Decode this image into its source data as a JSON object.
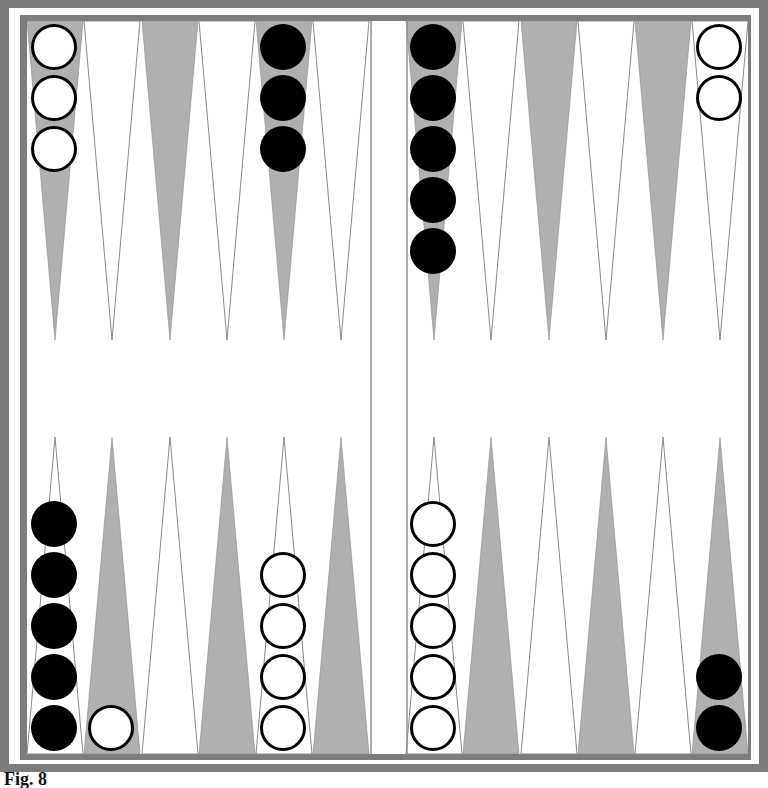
{
  "caption": "Fig. 8",
  "colors": {
    "frame": "#7d7d7d",
    "shaded_point": "#b0b0b0",
    "point_outline": "#8a8a8a",
    "board_bg": "#ffffff",
    "black_checker": "#000000",
    "white_checker_fill": "#ffffff",
    "white_checker_stroke": "#000000"
  },
  "board": {
    "top_points": [
      {
        "index": 0,
        "shaded": true,
        "checkers": {
          "color": "white",
          "count": 3
        }
      },
      {
        "index": 1,
        "shaded": false,
        "checkers": {
          "color": null,
          "count": 0
        }
      },
      {
        "index": 2,
        "shaded": true,
        "checkers": {
          "color": null,
          "count": 0
        }
      },
      {
        "index": 3,
        "shaded": false,
        "checkers": {
          "color": null,
          "count": 0
        }
      },
      {
        "index": 4,
        "shaded": true,
        "checkers": {
          "color": "black",
          "count": 3
        }
      },
      {
        "index": 5,
        "shaded": false,
        "checkers": {
          "color": null,
          "count": 0
        }
      },
      {
        "index": 6,
        "shaded": true,
        "checkers": {
          "color": "black",
          "count": 5
        }
      },
      {
        "index": 7,
        "shaded": false,
        "checkers": {
          "color": null,
          "count": 0
        }
      },
      {
        "index": 8,
        "shaded": true,
        "checkers": {
          "color": null,
          "count": 0
        }
      },
      {
        "index": 9,
        "shaded": false,
        "checkers": {
          "color": null,
          "count": 0
        }
      },
      {
        "index": 10,
        "shaded": true,
        "checkers": {
          "color": null,
          "count": 0
        }
      },
      {
        "index": 11,
        "shaded": false,
        "checkers": {
          "color": "white",
          "count": 2
        }
      }
    ],
    "bottom_points": [
      {
        "index": 0,
        "shaded": false,
        "checkers": {
          "color": "black",
          "count": 5
        }
      },
      {
        "index": 1,
        "shaded": true,
        "checkers": {
          "color": "white",
          "count": 1
        }
      },
      {
        "index": 2,
        "shaded": false,
        "checkers": {
          "color": null,
          "count": 0
        }
      },
      {
        "index": 3,
        "shaded": true,
        "checkers": {
          "color": null,
          "count": 0
        }
      },
      {
        "index": 4,
        "shaded": false,
        "checkers": {
          "color": "white",
          "count": 4
        }
      },
      {
        "index": 5,
        "shaded": true,
        "checkers": {
          "color": null,
          "count": 0
        }
      },
      {
        "index": 6,
        "shaded": false,
        "checkers": {
          "color": "white",
          "count": 5
        }
      },
      {
        "index": 7,
        "shaded": true,
        "checkers": {
          "color": null,
          "count": 0
        }
      },
      {
        "index": 8,
        "shaded": false,
        "checkers": {
          "color": null,
          "count": 0
        }
      },
      {
        "index": 9,
        "shaded": true,
        "checkers": {
          "color": null,
          "count": 0
        }
      },
      {
        "index": 10,
        "shaded": false,
        "checkers": {
          "color": null,
          "count": 0
        }
      },
      {
        "index": 11,
        "shaded": true,
        "checkers": {
          "color": "black",
          "count": 2
        }
      }
    ],
    "totals": {
      "white": 15,
      "black": 15
    }
  }
}
